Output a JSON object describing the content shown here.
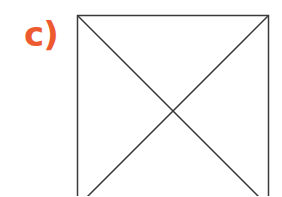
{
  "label": {
    "text": "c)",
    "color": "#EE5A2F"
  },
  "figure": {
    "shape": "square-with-diagonals",
    "stroke_color": "#3a3a3a",
    "square": {
      "x": 77.5,
      "y": 15.5,
      "size": 191
    }
  }
}
